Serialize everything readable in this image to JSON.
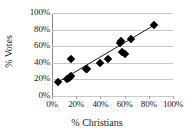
{
  "chart_data": {
    "type": "scatter",
    "title": "",
    "xlabel": "% Christians",
    "ylabel": "% Votes",
    "xlim": [
      0,
      100
    ],
    "ylim": [
      0,
      100
    ],
    "xticks": [
      "0%",
      "20%",
      "40%",
      "60%",
      "80%",
      "100%"
    ],
    "yticks": [
      "0%",
      "20%",
      "40%",
      "60%",
      "80%",
      "100%"
    ],
    "xtick_values": [
      0,
      20,
      40,
      60,
      80,
      100
    ],
    "ytick_values": [
      0,
      20,
      40,
      60,
      80,
      100
    ],
    "grid": "horizontal",
    "legend": "none",
    "marker": "filled-diamond",
    "marker_color": "#000000",
    "points": [
      {
        "x": 5,
        "y": 17
      },
      {
        "x": 12,
        "y": 21
      },
      {
        "x": 14,
        "y": 22
      },
      {
        "x": 15,
        "y": 23
      },
      {
        "x": 16,
        "y": 24
      },
      {
        "x": 16,
        "y": 45
      },
      {
        "x": 28,
        "y": 32
      },
      {
        "x": 29,
        "y": 33
      },
      {
        "x": 40,
        "y": 40
      },
      {
        "x": 46,
        "y": 45
      },
      {
        "x": 56,
        "y": 64
      },
      {
        "x": 57,
        "y": 66
      },
      {
        "x": 58,
        "y": 53
      },
      {
        "x": 60,
        "y": 51
      },
      {
        "x": 65,
        "y": 69
      },
      {
        "x": 84,
        "y": 86
      }
    ],
    "trendline": {
      "type": "linear",
      "x_start": 4,
      "y_start": 16,
      "x_end": 84,
      "y_end": 85,
      "color": "#1a1a1a"
    }
  }
}
